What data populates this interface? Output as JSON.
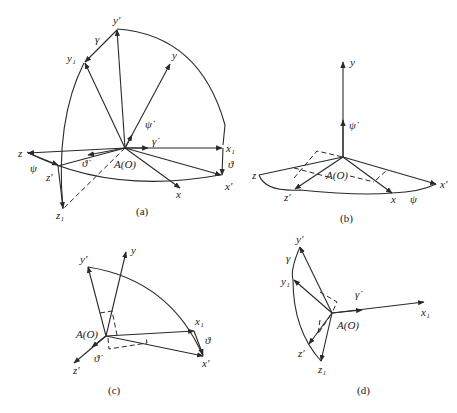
{
  "figure": {
    "panel_a": {
      "caption": "(a)",
      "labels": {
        "y_prime": "y′",
        "gamma": "γ",
        "y1": "y₁",
        "y": "y",
        "psi_dot": "ψ̇",
        "gamma_dot": "γ̇",
        "z": "z",
        "psi": "ψ",
        "theta_dot": "ϑ̇",
        "z_prime": "z′",
        "origin": "A(O)",
        "x1": "x₁",
        "theta": "ϑ",
        "x": "x",
        "x_prime": "x′",
        "z1": "z₁"
      }
    },
    "panel_b": {
      "caption": "(b)",
      "labels": {
        "y": "y",
        "psi_dot": "ψ̇",
        "z": "z",
        "origin": "A(O)",
        "x_prime": "x′",
        "z_prime": "z′",
        "x": "x",
        "psi": "ψ"
      }
    },
    "panel_c": {
      "caption": "(c)",
      "labels": {
        "y_prime": "y′",
        "y": "y",
        "origin": "A(O)",
        "x1": "x₁",
        "theta": "ϑ",
        "x_prime": "x′",
        "theta_dot": "ϑ̇",
        "z_prime": "z′"
      }
    },
    "panel_d": {
      "caption": "(d)",
      "labels": {
        "y_prime": "y′",
        "gamma": "γ",
        "y1": "y₁",
        "gamma_dot": "γ̇",
        "origin": "A(O)",
        "x1": "x₁",
        "z_prime": "z′",
        "z1": "z₁"
      }
    }
  }
}
